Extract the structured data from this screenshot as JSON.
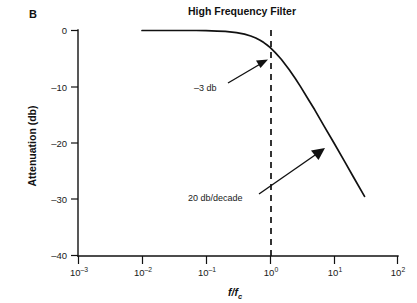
{
  "figure": {
    "panel_letter": "B",
    "title": "High Frequency Filter"
  },
  "axes": {
    "y_title": "Attenuation (db)",
    "x_title_numerator": "f",
    "x_title_slash": "/",
    "x_title_denominator": "f",
    "x_title_subscript": "c",
    "y_ticks": [
      "0",
      "–10",
      "–20",
      "–30",
      "–40"
    ],
    "x_tick_bases": [
      "10",
      "10",
      "10",
      "10",
      "10",
      "10"
    ],
    "x_tick_exponents": [
      "–3",
      "–2",
      "–1",
      "0",
      "1",
      "2"
    ]
  },
  "annotations": {
    "cutoff_label": "–3 db",
    "slope_label": "20 db/decade"
  },
  "colors": {
    "ink": "#111111",
    "background": "#ffffff"
  },
  "chart_data": {
    "type": "line",
    "title": "High Frequency Filter",
    "xlabel": "f/fc",
    "ylabel": "Attenuation (db)",
    "xscale": "log",
    "xlim": [
      0.001,
      100
    ],
    "ylim": [
      -40,
      0
    ],
    "grid": false,
    "legend": null,
    "xtick_values": [
      0.001,
      0.01,
      0.1,
      1,
      10,
      100
    ],
    "xtick_labels": [
      "10-3",
      "10-2",
      "10-1",
      "100",
      "101",
      "102"
    ],
    "ytick_values": [
      0,
      -10,
      -20,
      -30,
      -40
    ],
    "ytick_labels": [
      "0",
      "-10",
      "-20",
      "-30",
      "-40"
    ],
    "series": [
      {
        "name": "Low-pass filter response",
        "description": "First-order low-pass magnitude response, -3 db at f/fc = 1, rolling off at 20 db/decade",
        "x": [
          0.01,
          0.02,
          0.04,
          0.07,
          0.1,
          0.15,
          0.2,
          0.3,
          0.4,
          0.5,
          0.6,
          0.7,
          0.8,
          0.9,
          1.0,
          1.2,
          1.5,
          2.0,
          2.5,
          3.0,
          4.0,
          5.0,
          7.0,
          10.0,
          15.0,
          20.0,
          30.0
        ],
        "y": [
          0.0,
          0.0,
          0.0,
          0.0,
          -0.04,
          -0.1,
          -0.17,
          -0.37,
          -0.64,
          -0.97,
          -1.34,
          -1.73,
          -2.15,
          -2.58,
          -3.01,
          -3.88,
          -5.12,
          -6.99,
          -8.59,
          -9.98,
          -12.3,
          -14.1,
          -17.0,
          -20.0,
          -23.5,
          -26.0,
          -29.5
        ]
      }
    ],
    "reference_lines": [
      {
        "name": "cutoff-frequency",
        "orientation": "vertical",
        "value": 1.0,
        "style": "dashed"
      }
    ],
    "annotations": [
      {
        "text": "-3 db",
        "points_to_x": 1.0,
        "points_to_y": -3.0
      },
      {
        "text": "20 db/decade",
        "points_to_x": 6.0,
        "points_to_y": -15.0
      }
    ]
  }
}
